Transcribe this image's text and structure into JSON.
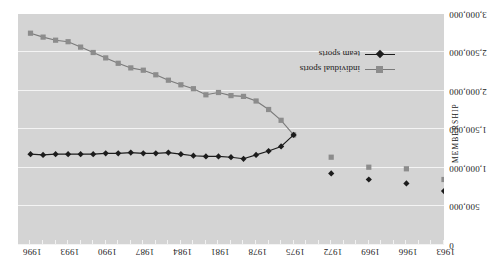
{
  "chart_data": {
    "type": "line",
    "title": "",
    "xlabel": "",
    "ylabel": "MEMBERSHIP",
    "ylim": [
      0,
      3000000
    ],
    "xlim": [
      1963,
      1997
    ],
    "grid": true,
    "legend_position": "bottom-right",
    "y_ticks": [
      "0",
      "500,000",
      "1,000,000",
      "1,500,000",
      "2,000,000",
      "2,500,000",
      "3,000,000"
    ],
    "y_tick_values": [
      0,
      500000,
      1000000,
      1500000,
      2000000,
      2500000,
      3000000
    ],
    "x_ticks": [
      "1963",
      "1966",
      "1969",
      "1972",
      "1975",
      "1978",
      "1981",
      "1984",
      "1987",
      "1990",
      "1993",
      "1996"
    ],
    "x_tick_values": [
      1963,
      1966,
      1969,
      1972,
      1975,
      1978,
      1981,
      1984,
      1987,
      1990,
      1993,
      1996
    ],
    "rotation_degrees": 180,
    "series": [
      {
        "name": "individual sports",
        "marker": "square",
        "color": "#8c8c8c",
        "line_color": "#7a7a7a",
        "connected_from": 1975,
        "x": [
          1963,
          1966,
          1969,
          1972,
          1975,
          1976,
          1977,
          1978,
          1979,
          1980,
          1981,
          1982,
          1983,
          1984,
          1985,
          1986,
          1987,
          1988,
          1989,
          1990,
          1991,
          1992,
          1993,
          1994,
          1995,
          1996
        ],
        "values": [
          850000,
          990000,
          1010000,
          1140000,
          1430000,
          1620000,
          1760000,
          1870000,
          1930000,
          1940000,
          1980000,
          1950000,
          2030000,
          2080000,
          2140000,
          2210000,
          2270000,
          2300000,
          2360000,
          2430000,
          2500000,
          2570000,
          2640000,
          2660000,
          2700000,
          2750000
        ]
      },
      {
        "name": "team sports",
        "marker": "diamond",
        "color": "#1c1c1c",
        "line_color": "#1c1c1c",
        "connected_from": 1975,
        "x": [
          1963,
          1966,
          1969,
          1972,
          1975,
          1976,
          1977,
          1978,
          1979,
          1980,
          1981,
          1982,
          1983,
          1984,
          1985,
          1986,
          1987,
          1988,
          1989,
          1990,
          1991,
          1992,
          1993,
          1994,
          1995,
          1996
        ],
        "values": [
          700000,
          800000,
          850000,
          930000,
          1430000,
          1280000,
          1220000,
          1170000,
          1120000,
          1140000,
          1150000,
          1150000,
          1160000,
          1180000,
          1200000,
          1190000,
          1190000,
          1200000,
          1190000,
          1190000,
          1180000,
          1180000,
          1180000,
          1180000,
          1170000,
          1180000
        ]
      }
    ]
  },
  "legend": {
    "items": [
      {
        "label": "individual sports"
      },
      {
        "label": "team sports"
      }
    ]
  },
  "colors": {
    "plot_background": "#d4d4d4",
    "gridline": "#f4f4f4",
    "page_background": "#ffffff",
    "individual_sports": "#8c8c8c",
    "team_sports": "#1c1c1c"
  }
}
